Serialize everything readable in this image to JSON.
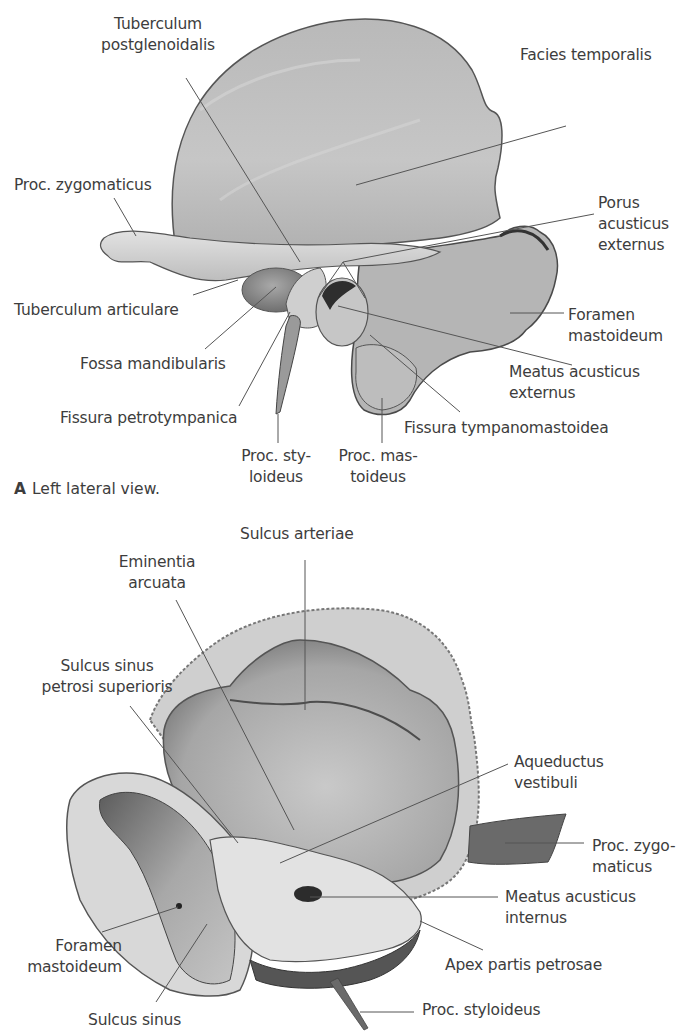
{
  "figure": {
    "panel_a": {
      "caption_letter": "A",
      "caption_text": "Left lateral view.",
      "labels": [
        {
          "id": "tuberculum-postglenoidalis",
          "text": "Tuberculum\npostglenoidalis",
          "x": 88,
          "y": 14,
          "w": 140,
          "align": "center"
        },
        {
          "id": "facies-temporalis",
          "text": "Facies temporalis",
          "x": 520,
          "y": 45,
          "w": 160,
          "align": "left"
        },
        {
          "id": "proc-zygomaticus",
          "text": "Proc. zygomaticus",
          "x": 14,
          "y": 175,
          "w": 160,
          "align": "left"
        },
        {
          "id": "porus-acusticus-externus",
          "text": "Porus\nacusticus\nexternus",
          "x": 598,
          "y": 193,
          "w": 84,
          "align": "left"
        },
        {
          "id": "tuberculum-articulare",
          "text": "Tuberculum articulare",
          "x": 14,
          "y": 300,
          "w": 200,
          "align": "left"
        },
        {
          "id": "foramen-mastoideum-a",
          "text": "Foramen\nmastoideum",
          "x": 568,
          "y": 305,
          "w": 110,
          "align": "left"
        },
        {
          "id": "fossa-mandibularis",
          "text": "Fossa mandibularis",
          "x": 80,
          "y": 354,
          "w": 170,
          "align": "left"
        },
        {
          "id": "meatus-acusticus-externus",
          "text": "Meatus acusticus\nexternus",
          "x": 509,
          "y": 362,
          "w": 160,
          "align": "left"
        },
        {
          "id": "fissura-petrotympanica",
          "text": "Fissura petrotympanica",
          "x": 60,
          "y": 408,
          "w": 200,
          "align": "left"
        },
        {
          "id": "fissura-tympanomastoidea",
          "text": "Fissura tympanomastoidea",
          "x": 404,
          "y": 418,
          "w": 240,
          "align": "left"
        },
        {
          "id": "proc-styloideus-a",
          "text": "Proc. sty-\nloideus",
          "x": 236,
          "y": 446,
          "w": 80,
          "align": "center"
        },
        {
          "id": "proc-mastoideus",
          "text": "Proc. mas-\ntoideus",
          "x": 336,
          "y": 446,
          "w": 84,
          "align": "center"
        }
      ],
      "leaders": [
        {
          "for": "tuberculum-postglenoidalis",
          "x1": 186,
          "y1": 78,
          "x2": 300,
          "y2": 262
        },
        {
          "for": "facies-temporalis",
          "x1": 566,
          "y1": 126,
          "x2": 356,
          "y2": 185
        },
        {
          "for": "proc-zygomaticus",
          "x1": 114,
          "y1": 198,
          "x2": 136,
          "y2": 236
        },
        {
          "for": "porus-acusticus-externus",
          "x1": 594,
          "y1": 214,
          "x2": 343,
          "y2": 262
        },
        {
          "for": "porus-acusticus-externus",
          "x1": 343,
          "y1": 262,
          "x2": 318,
          "y2": 298
        },
        {
          "for": "porus-acusticus-externus",
          "x1": 343,
          "y1": 262,
          "x2": 365,
          "y2": 298
        },
        {
          "for": "tuberculum-articulare",
          "x1": 193,
          "y1": 295,
          "x2": 238,
          "y2": 280
        },
        {
          "for": "fossa-mandibularis",
          "x1": 205,
          "y1": 349,
          "x2": 276,
          "y2": 287
        },
        {
          "for": "fissura-petrotympanica",
          "x1": 239,
          "y1": 406,
          "x2": 290,
          "y2": 312
        },
        {
          "for": "foramen-mastoideum-a",
          "x1": 564,
          "y1": 313,
          "x2": 510,
          "y2": 313
        },
        {
          "for": "meatus-acusticus-externus",
          "x1": 572,
          "y1": 365,
          "x2": 338,
          "y2": 306
        },
        {
          "for": "fissura-tympanomastoidea",
          "x1": 460,
          "y1": 412,
          "x2": 370,
          "y2": 335
        },
        {
          "for": "proc-styloideus-a",
          "x1": 278,
          "y1": 443,
          "x2": 278,
          "y2": 414
        },
        {
          "for": "proc-mastoideus",
          "x1": 382,
          "y1": 443,
          "x2": 382,
          "y2": 398
        }
      ]
    },
    "panel_b": {
      "labels": [
        {
          "id": "sulcus-arteriae",
          "text": "Sulcus arteriae",
          "x": 240,
          "y": 524,
          "w": 150,
          "align": "left"
        },
        {
          "id": "eminentia-arcuata",
          "text": "Eminentia\narcuata",
          "x": 102,
          "y": 552,
          "w": 110,
          "align": "center"
        },
        {
          "id": "sulcus-sinus-petrosi-superioris",
          "text": "Sulcus sinus\npetrosi superioris",
          "x": 22,
          "y": 656,
          "w": 170,
          "align": "center"
        },
        {
          "id": "aqueductus-vestibuli",
          "text": "Aqueductus\nvestibuli",
          "x": 514,
          "y": 752,
          "w": 120,
          "align": "left"
        },
        {
          "id": "proc-zygomaticus-b",
          "text": "Proc. zygo-\nmaticus",
          "x": 592,
          "y": 836,
          "w": 92,
          "align": "left"
        },
        {
          "id": "meatus-acusticus-internus",
          "text": "Meatus acusticus\ninternus",
          "x": 505,
          "y": 887,
          "w": 170,
          "align": "left"
        },
        {
          "id": "foramen-mastoideum-b",
          "text": "Foramen\nmastoideum",
          "x": 10,
          "y": 936,
          "w": 112,
          "align": "right"
        },
        {
          "id": "apex-partis-petrosae",
          "text": "Apex partis petrosae",
          "x": 445,
          "y": 955,
          "w": 190,
          "align": "left"
        },
        {
          "id": "proc-styloideus-b",
          "text": "Proc. styloideus",
          "x": 422,
          "y": 1000,
          "w": 160,
          "align": "left"
        },
        {
          "id": "sulcus-sinus",
          "text": "Sulcus sinus",
          "x": 88,
          "y": 1010,
          "w": 120,
          "align": "left"
        }
      ],
      "leaders": [
        {
          "for": "sulcus-arteriae",
          "x1": 305,
          "y1": 560,
          "x2": 305,
          "y2": 710
        },
        {
          "for": "eminentia-arcuata",
          "x1": 176,
          "y1": 600,
          "x2": 294,
          "y2": 830
        },
        {
          "for": "sulcus-sinus-petrosi-superioris",
          "x1": 130,
          "y1": 706,
          "x2": 238,
          "y2": 843
        },
        {
          "for": "aqueductus-vestibuli",
          "x1": 508,
          "y1": 764,
          "x2": 280,
          "y2": 863
        },
        {
          "for": "proc-zygomaticus-b",
          "x1": 584,
          "y1": 843,
          "x2": 505,
          "y2": 843
        },
        {
          "for": "meatus-acusticus-internus",
          "x1": 498,
          "y1": 897,
          "x2": 310,
          "y2": 897
        },
        {
          "for": "apex-partis-petrosae",
          "x1": 483,
          "y1": 950,
          "x2": 420,
          "y2": 921
        },
        {
          "for": "foramen-mastoideum-b",
          "x1": 102,
          "y1": 932,
          "x2": 178,
          "y2": 907
        },
        {
          "for": "sulcus-sinus",
          "x1": 156,
          "y1": 1002,
          "x2": 207,
          "y2": 924
        },
        {
          "for": "proc-styloideus-b",
          "x1": 414,
          "y1": 1012,
          "x2": 360,
          "y2": 1012
        }
      ]
    }
  },
  "colors": {
    "background": "#ffffff",
    "text": "#3d3d3d",
    "leader": "#555555",
    "bone_light": "#d4d4d4",
    "bone_mid": "#b3b3b3",
    "bone_dark": "#6e6e6e",
    "bone_shadow": "#3f3f3f"
  }
}
